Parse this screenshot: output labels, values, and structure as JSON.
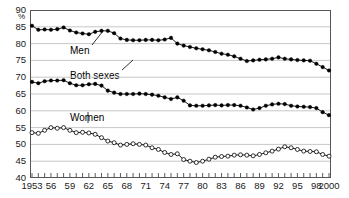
{
  "chart_data": {
    "type": "line",
    "title": "",
    "subtitle": "",
    "xlabel": "",
    "ylabel": "%",
    "ylim": [
      40,
      90
    ],
    "ytick_values": [
      40,
      45,
      50,
      55,
      60,
      65,
      70,
      75,
      80,
      85,
      90
    ],
    "ytick_labels": [
      "40",
      "45",
      "50",
      "55",
      "60",
      "65",
      "70",
      "75",
      "80",
      "85",
      "90"
    ],
    "grid": true,
    "legend_position": "inline-annotations",
    "x": [
      1953,
      1954,
      1955,
      1956,
      1957,
      1958,
      1959,
      1960,
      1961,
      1962,
      1963,
      1964,
      1965,
      1966,
      1967,
      1968,
      1969,
      1970,
      1971,
      1972,
      1973,
      1974,
      1975,
      1976,
      1977,
      1978,
      1979,
      1980,
      1981,
      1982,
      1983,
      1984,
      1985,
      1986,
      1987,
      1988,
      1989,
      1990,
      1991,
      1992,
      1993,
      1994,
      1995,
      1996,
      1997,
      1998,
      1999,
      2000
    ],
    "xtick_values": [
      1953,
      1956,
      1959,
      1962,
      1965,
      1968,
      1971,
      1974,
      1977,
      1980,
      1983,
      1986,
      1989,
      1992,
      1995,
      1998,
      2000
    ],
    "xtick_labels": [
      "1953",
      "56",
      "59",
      "62",
      "65",
      "68",
      "71",
      "74",
      "77",
      "80",
      "83",
      "86",
      "89",
      "92",
      "95",
      "98",
      "2000"
    ],
    "series": [
      {
        "name": "Men",
        "marker": "filled-circle",
        "color": "#000000",
        "annotation": "Men",
        "values": [
          85.3,
          84.1,
          84.2,
          84.1,
          84.3,
          84.8,
          83.9,
          83.3,
          83.0,
          82.8,
          83.5,
          83.8,
          83.8,
          83.1,
          81.5,
          81.1,
          81.0,
          81.0,
          81.1,
          81.1,
          81.0,
          81.2,
          81.7,
          80.0,
          79.4,
          79.0,
          78.6,
          78.3,
          78.0,
          77.5,
          77.0,
          76.7,
          76.2,
          75.5,
          74.8,
          75.0,
          75.2,
          75.3,
          75.5,
          75.9,
          75.5,
          75.3,
          75.1,
          75.0,
          74.9,
          74.0,
          73.0,
          72.0
        ]
      },
      {
        "name": "Both sexes",
        "marker": "filled-circle",
        "color": "#000000",
        "annotation": "Both sexes",
        "values": [
          68.6,
          68.2,
          68.8,
          69.0,
          69.0,
          69.1,
          68.2,
          67.6,
          67.6,
          67.9,
          68.0,
          67.5,
          66.0,
          65.4,
          65.0,
          65.0,
          65.0,
          65.1,
          65.0,
          64.8,
          64.5,
          64.0,
          63.5,
          64.0,
          63.0,
          61.6,
          61.5,
          61.5,
          61.6,
          61.7,
          61.6,
          61.7,
          61.7,
          61.5,
          61.0,
          60.4,
          60.8,
          61.5,
          61.9,
          62.1,
          62.0,
          61.5,
          61.3,
          61.2,
          61.1,
          60.8,
          59.6,
          58.7
        ]
      },
      {
        "name": "Women",
        "marker": "open-circle",
        "color": "#000000",
        "annotation": "Women",
        "values": [
          53.5,
          53.3,
          54.2,
          55.0,
          54.8,
          55.0,
          54.2,
          53.5,
          53.6,
          53.4,
          53.0,
          52.0,
          51.0,
          50.5,
          49.8,
          50.0,
          50.2,
          50.0,
          49.8,
          49.0,
          48.5,
          47.6,
          47.0,
          47.2,
          45.5,
          45.0,
          44.6,
          45.0,
          45.6,
          46.2,
          46.4,
          46.5,
          46.8,
          46.9,
          46.8,
          46.6,
          47.0,
          47.5,
          48.0,
          48.6,
          49.3,
          49.0,
          48.5,
          48.0,
          47.9,
          47.8,
          47.0,
          46.5
        ]
      }
    ]
  },
  "annotations": {
    "men_label": "Men",
    "both_label": "Both sexes",
    "women_label": "Women",
    "percent_symbol": "%"
  }
}
